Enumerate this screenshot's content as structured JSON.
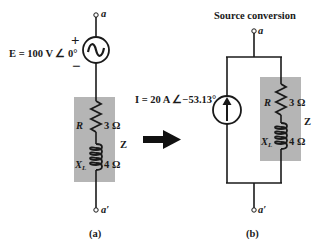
{
  "figure": {
    "title_right": "Source conversion",
    "arrow": "conversion-arrow"
  },
  "circuit_a": {
    "caption": "(a)",
    "top_terminal": "a",
    "bottom_terminal": "a′",
    "source": {
      "type": "ac-voltage-source",
      "label": "E = 100 V ∠ 0°",
      "plus": "+",
      "minus": "−"
    },
    "impedance": {
      "label": "Z",
      "resistor": {
        "symbol": "R",
        "value": "3 Ω"
      },
      "inductor": {
        "symbol": "X",
        "subscript": "L",
        "value": "4 Ω"
      }
    }
  },
  "circuit_b": {
    "caption": "(b)",
    "top_terminal": "a",
    "bottom_terminal": "a′",
    "source": {
      "type": "current-source",
      "label": "I = 20 A ∠−53.13°"
    },
    "impedance": {
      "label": "Z",
      "resistor": {
        "symbol": "R",
        "value": "3 Ω"
      },
      "inductor": {
        "symbol": "X",
        "subscript": "L",
        "value": "4 Ω"
      }
    }
  },
  "colors": {
    "wire": "#1a1a1a",
    "impedance_box": "#b5b5b5",
    "background": "#ffffff"
  }
}
